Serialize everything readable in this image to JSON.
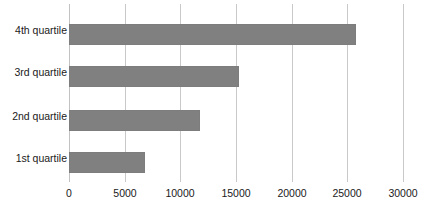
{
  "chart_data": {
    "type": "bar",
    "orientation": "horizontal",
    "title": "",
    "subtitle": "",
    "xlabel": "",
    "ylabel": "",
    "categories": [
      "1st quartile",
      "2nd quartile",
      "3rd quartile",
      "4th quartile"
    ],
    "values": [
      6800,
      11800,
      15300,
      25800
    ],
    "series": [
      {
        "name": "",
        "values": [
          6800,
          11800,
          15300,
          25800
        ],
        "color": "#808080"
      }
    ],
    "xlim": [
      0,
      30000
    ],
    "xticks": [
      0,
      5000,
      10000,
      15000,
      20000,
      25000,
      30000
    ],
    "xtick_labels": [
      "0",
      "5000",
      "10000",
      "15000",
      "20000",
      "25000",
      "30000"
    ],
    "grid": "vertical",
    "legend": "none",
    "bar_color": "#808080",
    "gridline_color": "#c9c9c9",
    "background_color": "#ffffff",
    "category_order_top_to_bottom": [
      "4th quartile",
      "3rd quartile",
      "2nd quartile",
      "1st quartile"
    ]
  },
  "axis": {
    "x_tick_labels": [
      "0",
      "5000",
      "10000",
      "15000",
      "20000",
      "25000",
      "30000"
    ],
    "y_category_labels_top_to_bottom": [
      "4th quartile",
      "3rd quartile",
      "2nd quartile",
      "1st quartile"
    ]
  }
}
